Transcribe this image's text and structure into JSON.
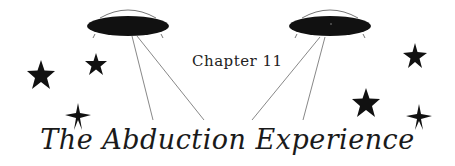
{
  "chapter_label": "Chapter 11",
  "title": "The Abduction Experience",
  "illustration": {
    "saucers": [
      {
        "name": "left-saucer",
        "cx": 128,
        "cy": 26
      },
      {
        "name": "right-saucer",
        "cx": 330,
        "cy": 26
      }
    ],
    "stars": [
      {
        "x": 41,
        "y": 75,
        "r": 14
      },
      {
        "x": 96,
        "y": 64,
        "r": 12
      },
      {
        "x": 78,
        "y": 117,
        "r": 13
      },
      {
        "x": 415,
        "y": 56,
        "r": 13
      },
      {
        "x": 366,
        "y": 102,
        "r": 14
      },
      {
        "x": 419,
        "y": 117,
        "r": 13
      }
    ],
    "colors": {
      "ink": "#111111",
      "beam": "#888888",
      "dome": "#777777"
    }
  }
}
